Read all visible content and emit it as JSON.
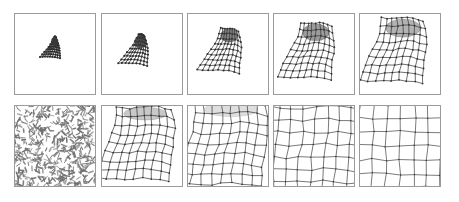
{
  "figure": {
    "title": "Self-organizing map grid unfolding sequence",
    "background_color": "#ffffff",
    "panel_border_color": "#9b9b9b",
    "mesh_color": "#4a4a4a",
    "node_color": "#2e2e2e",
    "data_point_color": "#6f6f6f",
    "blob_color": "#3a3a3a",
    "rows": 2,
    "columns": 5,
    "panel_size_px": 82
  },
  "panels": [
    {
      "id": "panel-r1c1",
      "row": 1,
      "column": 1,
      "kind": "mesh",
      "label": "step-1",
      "description": "tiny collapsed dark blob near panel center, grid fully contracted",
      "state": "collapsed-blob",
      "x": 14,
      "y": 13,
      "w": 82,
      "h": 82
    },
    {
      "id": "panel-r1c2",
      "row": 1,
      "column": 2,
      "kind": "mesh",
      "label": "step-2",
      "description": "small elongated dark wedge, grid beginning to stretch downward-left",
      "state": "early-wedge",
      "x": 101,
      "y": 13,
      "w": 82,
      "h": 82
    },
    {
      "id": "panel-r1c3",
      "row": 1,
      "column": 3,
      "kind": "mesh",
      "label": "step-3",
      "description": "wedge with faintly visible grid lattice, dense dark cap at top right",
      "state": "wedge-with-lattice",
      "x": 187,
      "y": 13,
      "w": 82,
      "h": 82
    },
    {
      "id": "panel-r1c4",
      "row": 1,
      "column": 4,
      "kind": "mesh",
      "label": "step-4",
      "description": "triangular fan mesh, rows resolved, dark knot at apex",
      "state": "triangular-fan",
      "x": 273,
      "y": 13,
      "w": 82,
      "h": 82
    },
    {
      "id": "panel-r1c5",
      "row": 1,
      "column": 5,
      "kind": "mesh",
      "label": "step-5",
      "description": "larger triangular mesh with curved right flank, apex still dense",
      "state": "expanded-fan",
      "x": 359,
      "y": 13,
      "w": 82,
      "h": 82
    },
    {
      "id": "panel-r2c1",
      "row": 2,
      "column": 1,
      "kind": "data",
      "label": "input-data",
      "description": "dense uniform random scatter of short dark dashes filling the whole square, the training input distribution",
      "state": "input-distribution",
      "point_count": 520,
      "x": 14,
      "y": 105,
      "w": 82,
      "h": 82
    },
    {
      "id": "panel-r2c2",
      "row": 2,
      "column": 2,
      "kind": "mesh",
      "label": "step-6",
      "description": "rounded quadrilateral mesh, lattice clearly resolved, dark band along top edge",
      "state": "rounded-mesh",
      "x": 101,
      "y": 105,
      "w": 82,
      "h": 82
    },
    {
      "id": "panel-r2c3",
      "row": 2,
      "column": 3,
      "kind": "mesh",
      "label": "step-7",
      "description": "fuller rounded mesh occupying more area, top edge still compressed and dark",
      "state": "fuller-mesh",
      "x": 187,
      "y": 105,
      "w": 82,
      "h": 82
    },
    {
      "id": "panel-r2c4",
      "row": 2,
      "column": 4,
      "kind": "mesh",
      "label": "step-8",
      "description": "expanded wavy grid with curved left and bottom edges, spacing nearly uniform",
      "state": "wavy-grid",
      "x": 273,
      "y": 105,
      "w": 82,
      "h": 82
    },
    {
      "id": "panel-r2c5",
      "row": 2,
      "column": 5,
      "kind": "mesh",
      "label": "step-9",
      "description": "nearly regular square grid filling the panel, converged map",
      "state": "converged-grid",
      "x": 359,
      "y": 105,
      "w": 82,
      "h": 82
    }
  ]
}
